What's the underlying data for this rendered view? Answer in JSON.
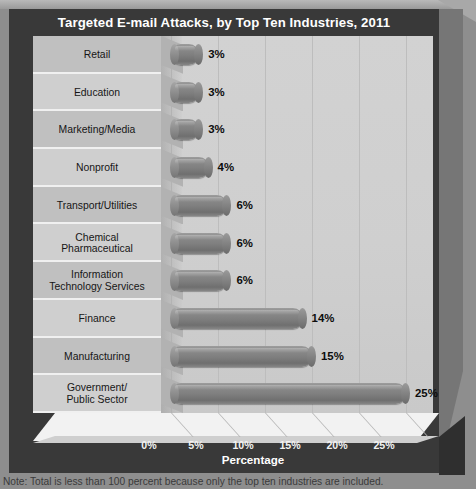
{
  "chart_data": {
    "type": "bar",
    "orientation": "horizontal",
    "title": "Targeted E-mail Attacks, by Top Ten Industries, 2011",
    "xlabel": "Percentage",
    "ylabel": "",
    "xlim": [
      0,
      30
    ],
    "xticks": [
      "0%",
      "5%",
      "10%",
      "15%",
      "20%",
      "25%"
    ],
    "xtick_values": [
      0,
      5,
      10,
      15,
      20,
      25
    ],
    "grid": true,
    "legend": "none",
    "categories": [
      "Retail",
      "Education",
      "Marketing/Media",
      "Nonprofit",
      "Transport/Utilities",
      "Chemical\nPharmaceutical",
      "Information\nTechnology Services",
      "Finance",
      "Manufacturing",
      "Government/\nPublic Sector"
    ],
    "values": [
      3,
      3,
      3,
      4,
      6,
      6,
      6,
      14,
      15,
      25
    ],
    "data_labels": [
      "3%",
      "3%",
      "3%",
      "4%",
      "6%",
      "6%",
      "6%",
      "14%",
      "15%",
      "25%"
    ],
    "note": "Note: Total is less than 100 percent because only the top ten industries are included.",
    "colors": {
      "bar": "#7f7f7f",
      "frame": "#393939",
      "plot_background": "#cfcfcf",
      "panel": "#cccccc",
      "title_text": "#ffffff",
      "value_text": "#0d0d0d"
    }
  },
  "rows": [
    {
      "label": "Retail",
      "label_line1": "Retail",
      "label_line2": "",
      "value": 3,
      "data_label": "3%"
    },
    {
      "label": "Education",
      "label_line1": "Education",
      "label_line2": "",
      "value": 3,
      "data_label": "3%"
    },
    {
      "label": "Marketing/Media",
      "label_line1": "Marketing/Media",
      "label_line2": "",
      "value": 3,
      "data_label": "3%"
    },
    {
      "label": "Nonprofit",
      "label_line1": "Nonprofit",
      "label_line2": "",
      "value": 4,
      "data_label": "4%"
    },
    {
      "label": "Transport/Utilities",
      "label_line1": "Transport/Utilities",
      "label_line2": "",
      "value": 6,
      "data_label": "6%"
    },
    {
      "label": "Chemical Pharmaceutical",
      "label_line1": "Chemical",
      "label_line2": "Pharmaceutical",
      "value": 6,
      "data_label": "6%"
    },
    {
      "label": "Information Technology Services",
      "label_line1": "Information",
      "label_line2": "Technology Services",
      "value": 6,
      "data_label": "6%"
    },
    {
      "label": "Finance",
      "label_line1": "Finance",
      "label_line2": "",
      "value": 14,
      "data_label": "14%"
    },
    {
      "label": "Manufacturing",
      "label_line1": "Manufacturing",
      "label_line2": "",
      "value": 15,
      "data_label": "15%"
    },
    {
      "label": "Government/ Public Sector",
      "label_line1": "Government/",
      "label_line2": "Public Sector",
      "value": 25,
      "data_label": "25%"
    }
  ],
  "axis": {
    "title": "Percentage",
    "ticks": [
      "0%",
      "5%",
      "10%",
      "15%",
      "20%",
      "25%"
    ]
  },
  "footer": {
    "note": "Note: Total is less than 100 percent because only the top ten industries are included."
  }
}
